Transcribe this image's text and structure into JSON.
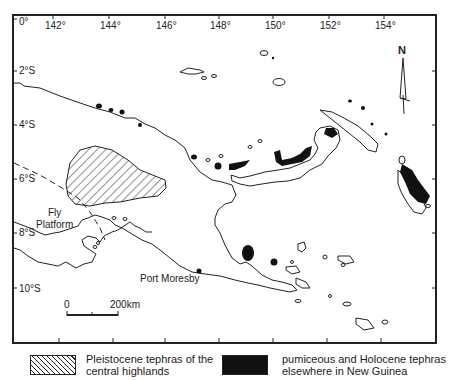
{
  "map": {
    "longitude_ticks": [
      "0°",
      "142°",
      "144°",
      "146°",
      "148°",
      "150°",
      "152°",
      "154°"
    ],
    "latitude_ticks": [
      "2°S",
      "4°S",
      "6°S",
      "8°S",
      "10°S"
    ],
    "north_arrow_label": "N",
    "places": {
      "fly_platform": "Fly\nPlatform",
      "port_moresby": "Port Moresby"
    },
    "scale_bar": {
      "start": "0",
      "end": "200km"
    },
    "colors": {
      "ink": "#1a1a1a",
      "tephra_fill": "#111111",
      "background": "#ffffff"
    }
  },
  "legend": {
    "items": [
      {
        "swatch": "hatched",
        "label_line1": "Pleistocene tephras of the",
        "label_line2": "central highlands"
      },
      {
        "swatch": "solid",
        "label_line1": "pumiceous and Holocene tephras",
        "label_line2": "elsewhere in New Guinea"
      }
    ]
  }
}
